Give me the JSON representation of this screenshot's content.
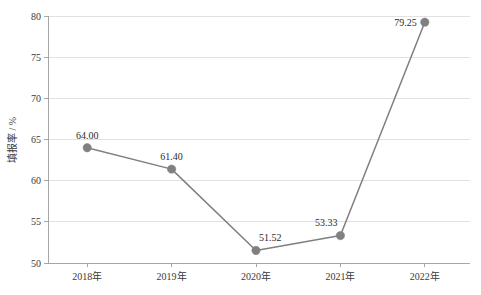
{
  "chart_data": {
    "type": "line",
    "title": "",
    "xlabel": "",
    "ylabel": "填报率 / %",
    "categories": [
      "2018年",
      "2019年",
      "2020年",
      "2021年",
      "2022年"
    ],
    "values": [
      64.0,
      61.4,
      51.52,
      53.33,
      79.25
    ],
    "point_labels": [
      "64.00",
      "61.40",
      "51.52",
      "53.33",
      "79.25"
    ],
    "ylim": [
      50,
      80
    ],
    "yticks": [
      50,
      55,
      60,
      65,
      70,
      75,
      80
    ],
    "ytick_labels": [
      "50",
      "55",
      "60",
      "65",
      "70",
      "75",
      "80"
    ],
    "grid": true,
    "legend": "none",
    "series": [
      {
        "name": "填报率",
        "values": [
          64.0,
          61.4,
          51.52,
          53.33,
          79.25
        ]
      }
    ],
    "colors": {
      "line": "#7f7f7f",
      "marker": "#808080",
      "grid": "#d9d9d9",
      "axis": "#a6a6a6",
      "text": "#2b2b2b",
      "background": "#ffffff"
    }
  }
}
